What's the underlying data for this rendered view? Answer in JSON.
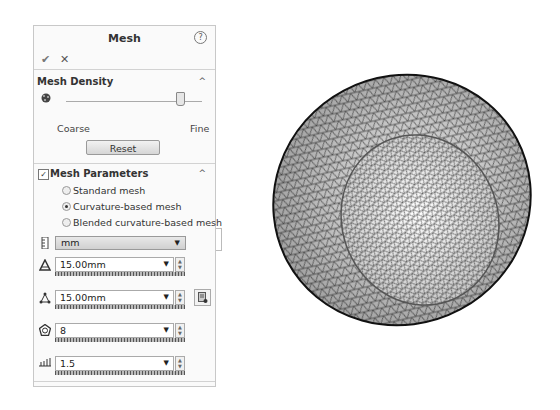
{
  "panel": {
    "title": "Mesh",
    "help_icon": "?",
    "ok_icon": "✔",
    "cancel_icon": "✕"
  },
  "mesh_density": {
    "title": "Mesh Density",
    "collapse_icon": "^",
    "slider_min_label": "Coarse",
    "slider_max_label": "Fine",
    "slider_position_pct": 82,
    "reset_label": "Reset"
  },
  "mesh_parameters": {
    "title": "Mesh Parameters",
    "checked": true,
    "checkbox_glyph": "✓",
    "collapse_icon": "^",
    "options": [
      {
        "label": "Standard mesh",
        "selected": false
      },
      {
        "label": "Curvature-based mesh",
        "selected": true
      },
      {
        "label": "Blended curvature-based mesh",
        "selected": false
      }
    ],
    "unit": "mm",
    "fields": [
      {
        "icon": "max-element-size-icon",
        "value": "15.00mm"
      },
      {
        "icon": "min-element-size-icon",
        "value": "15.00mm"
      },
      {
        "icon": "min-elements-in-circle-icon",
        "value": "8"
      },
      {
        "icon": "growth-ratio-icon",
        "value": "1.5"
      }
    ],
    "dropdown_arrow": "▼",
    "spin_up": "▲",
    "spin_down": "▼"
  },
  "viewport": {
    "object": "tetrahedral mesh of a curved shell (bowl-shaped part)"
  }
}
